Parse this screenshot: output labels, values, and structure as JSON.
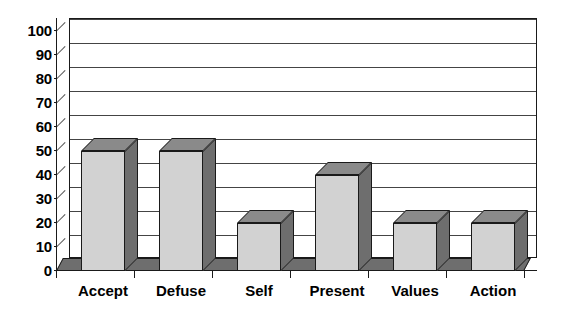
{
  "chart_data": {
    "type": "bar",
    "title": "",
    "subtitle": "",
    "xlabel": "",
    "ylabel": "",
    "categories": [
      "Accept",
      "Defuse",
      "Self",
      "Present",
      "Values",
      "Action"
    ],
    "values": [
      50,
      50,
      20,
      40,
      20,
      20
    ],
    "ylim": [
      0,
      100
    ],
    "ytick_step": 10,
    "yticks": [
      0,
      10,
      20,
      30,
      40,
      50,
      60,
      70,
      80,
      90,
      100
    ],
    "ytick_labels": [
      "0",
      "10",
      "20",
      "30",
      "40",
      "50",
      "60",
      "70",
      "80",
      "90",
      "100"
    ],
    "grid": true,
    "grid_axis": "y",
    "legend": false,
    "legend_position": "none",
    "style": "3d-column",
    "annotations": [],
    "series": [
      {
        "name": "",
        "values": [
          50,
          50,
          20,
          40,
          20,
          20
        ]
      }
    ]
  },
  "colors": {
    "bar_front": "#d2d2d2",
    "bar_side": "#6e6e6e",
    "bar_top": "#8a8a8a",
    "outline": "#1a1a1a",
    "gridline": "#444444",
    "background": "#ffffff",
    "text": "#000000"
  }
}
